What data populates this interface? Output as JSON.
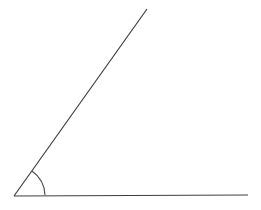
{
  "figure": {
    "background_color": "#ffffff",
    "stroke_color": "#3f3f3f",
    "arc_stroke_color": "#4a4a4a",
    "stroke_width": 1.2,
    "arc_stroke_width": 1.1,
    "width": 261,
    "height": 210
  },
  "chart_data": {
    "type": "diagram",
    "subtype": "angle",
    "title": "",
    "xlabel": "",
    "ylabel": "",
    "grid": false,
    "legend": false,
    "annotations": [],
    "vertex": {
      "name": "vertex",
      "x": 14,
      "y": 196
    },
    "rays": [
      {
        "name": "horizontal-ray",
        "from": {
          "x": 14,
          "y": 196
        },
        "to": {
          "x": 248,
          "y": 195
        },
        "length_px": 234,
        "angle_degrees": 0
      },
      {
        "name": "diagonal-ray",
        "from": {
          "x": 14,
          "y": 196
        },
        "to": {
          "x": 147,
          "y": 9
        },
        "length_px": 229.5,
        "angle_degrees": 54.6
      }
    ],
    "angle": {
      "name": "interior-angle",
      "value_degrees": 54.6,
      "label": "",
      "arc_radius_px": 31,
      "arc_start": {
        "x": 45,
        "y": 195
      },
      "arc_end": {
        "x": 32,
        "y": 171
      }
    }
  }
}
